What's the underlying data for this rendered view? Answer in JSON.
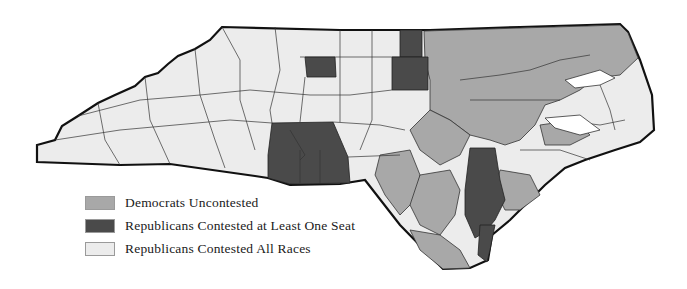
{
  "map": {
    "region": "North Carolina counties",
    "colors": {
      "democrats_uncontested": "#a8a8a8",
      "republicans_contested_at_least_one": "#4a4a4a",
      "republicans_contested_all": "#ececec",
      "border": "#111111",
      "county_line": "#333333"
    }
  },
  "legend": {
    "items": [
      {
        "label": "Democrats Uncontested",
        "color": "#a8a8a8"
      },
      {
        "label": "Republicans Contested at Least One Seat",
        "color": "#4a4a4a"
      },
      {
        "label": "Republicans Contested All Races",
        "color": "#ececec"
      }
    ]
  }
}
